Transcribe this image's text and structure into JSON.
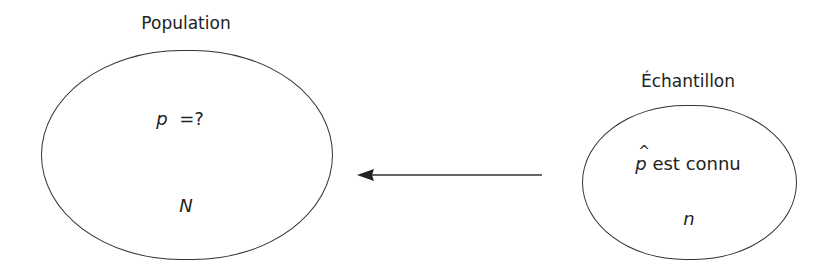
{
  "population": {
    "title": "Population",
    "parameter_symbol": "p",
    "parameter_value": "=?",
    "size_symbol": "N"
  },
  "sample": {
    "title": "Échantillon",
    "estimator_symbol": "p",
    "estimator_text": "est connu",
    "size_symbol": "n"
  },
  "arrow": {
    "direction": "sample-to-population",
    "color": "#333333"
  }
}
